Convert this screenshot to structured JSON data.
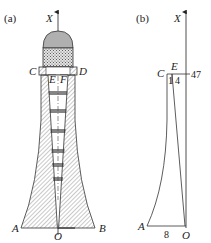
{
  "figure": {
    "panel_a": {
      "label": "(a)",
      "axis_label": "X",
      "points": {
        "C": "C",
        "D": "D",
        "E": "E",
        "F": "F",
        "A": "A",
        "B": "B",
        "O": "O"
      }
    },
    "panel_b": {
      "label": "(b)",
      "axis_label": "X",
      "points": {
        "C": "C",
        "E": "E",
        "A": "A",
        "O": "O"
      },
      "dimensions": {
        "top_width_left": "1",
        "top_width_right": "4",
        "height": "47",
        "base": "8"
      }
    },
    "colors": {
      "line": "#333333",
      "hatch": "#555555",
      "dome": "#b0b0b0",
      "crosshatch": "#777777"
    }
  }
}
